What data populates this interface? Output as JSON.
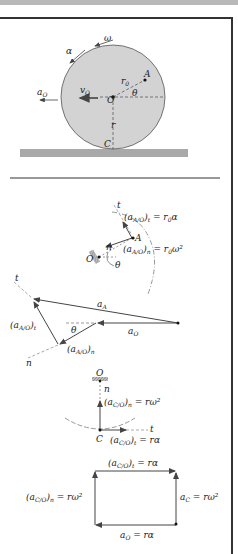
{
  "figure": {
    "top_diagram": {
      "labels": {
        "alpha": "α",
        "omega": "ω",
        "a_O": "a",
        "a_O_sub": "O",
        "v_O": "v",
        "v_O_sub": "O",
        "O": "O",
        "A": "A",
        "r_0": "r",
        "r_0_sub": "0",
        "theta": "θ",
        "r": "r",
        "C": "C"
      },
      "colors": {
        "disk_fill": "#d3d3d3",
        "ground_fill": "#a9a9a9"
      }
    },
    "relative_accel_A": {
      "t_label": "t",
      "tangential": "(a",
      "tangential_sub": "A/O",
      "tangential_rest": ")t = r₀α",
      "normal": "(a",
      "normal_sub": "A/O",
      "normal_rest": ")n = r₀ω²",
      "A": "A",
      "O": "O",
      "n": "n",
      "theta": "θ"
    },
    "vector_polygon_A": {
      "t": "t",
      "n": "n",
      "a_A": "aA",
      "a_O": "aO",
      "aAO_t": "(aA/O)t",
      "aAO_n": "(aA/O)n",
      "theta": "θ"
    },
    "relative_accel_C": {
      "O": "O",
      "n": "n",
      "normal": "(aC/O)n = rω²",
      "C": "C",
      "tangential": "(aC/O)t = rα",
      "t": "t"
    },
    "vector_polygon_C": {
      "top": "(aC/O)t = rα",
      "left": "(aC/O)n = rω²",
      "right": "aC = rω²",
      "bottom": "aO = rα"
    }
  }
}
